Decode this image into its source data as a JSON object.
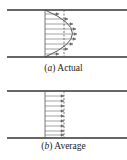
{
  "figures": [
    {
      "id": "a",
      "caption_open": "(",
      "caption_label": "a",
      "caption_close": ")",
      "caption_text": " Actual",
      "profile": "parabolic",
      "arrow_count": 9
    },
    {
      "id": "b",
      "caption_open": "(",
      "caption_label": "b",
      "caption_close": ")",
      "caption_text": " Average",
      "profile": "uniform",
      "arrow_count": 9
    }
  ],
  "colors": {
    "wall": "#333333",
    "line": "#555555",
    "background": "#ffffff"
  }
}
